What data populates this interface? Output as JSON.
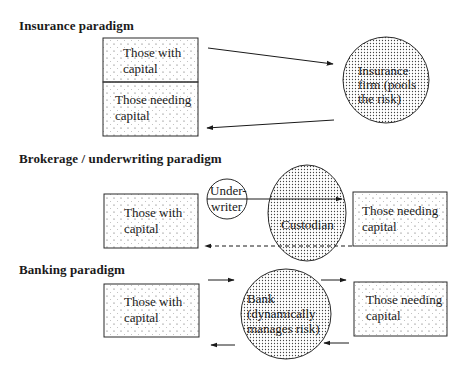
{
  "sections": [
    {
      "title": "Insurance paradigm",
      "nodes": {
        "box_top": {
          "line1": "Those with",
          "line2": "capital"
        },
        "box_bottom": {
          "line1": "Those needing",
          "line2": "capital"
        },
        "circle": {
          "line1": "Insurance",
          "line2": "firm (pools",
          "line3": "the risk)"
        }
      },
      "arrows": [
        {
          "from": "Those with capital",
          "to": "Insurance firm",
          "style": "solid"
        },
        {
          "from": "Insurance firm",
          "to": "Those needing capital",
          "style": "solid"
        }
      ]
    },
    {
      "title": "Brokerage / underwriting paradigm",
      "nodes": {
        "box_left": {
          "line1": "Those with",
          "line2": "capital"
        },
        "underwriter": {
          "line1": "Under-",
          "line2": "writer"
        },
        "custodian": {
          "line1": "Custodian"
        },
        "box_right": {
          "line1": "Those needing",
          "line2": "capital"
        }
      },
      "arrows": [
        {
          "from": "Underwriter",
          "to": "Those needing capital",
          "style": "solid"
        },
        {
          "from": "Those needing capital",
          "to": "Those with capital",
          "style": "dashed"
        }
      ]
    },
    {
      "title": "Banking paradigm",
      "nodes": {
        "box_left": {
          "line1": "Those with",
          "line2": "capital"
        },
        "bank": {
          "line1": "Bank",
          "line2": "(dynamically",
          "line3": "manages risk)"
        },
        "box_right": {
          "line1": "Those needing",
          "line2": "capital"
        }
      },
      "arrows": [
        {
          "from": "Those with capital",
          "to": "Bank",
          "style": "solid"
        },
        {
          "from": "Bank",
          "to": "Those with capital",
          "style": "solid"
        },
        {
          "from": "Bank",
          "to": "Those needing capital",
          "style": "solid"
        },
        {
          "from": "Those needing capital",
          "to": "Bank",
          "style": "solid"
        }
      ]
    }
  ],
  "colors": {
    "stroke": "#2a2a2a",
    "background": "#ffffff",
    "dot": "#555555"
  }
}
